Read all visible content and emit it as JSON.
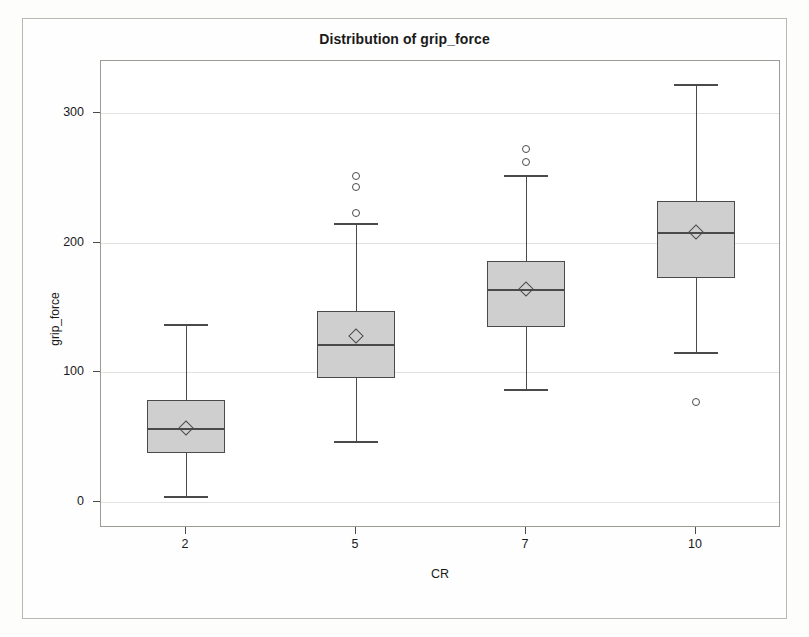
{
  "chart_data": {
    "type": "box",
    "title": "Distribution of grip_force",
    "xlabel": "CR",
    "ylabel": "grip_force",
    "categories": [
      "2",
      "5",
      "7",
      "10"
    ],
    "ylim": [
      -20,
      340
    ],
    "yticks": [
      0,
      100,
      200,
      300
    ],
    "ytick_labels": [
      "0",
      "100",
      "200",
      "300"
    ],
    "grid": true,
    "legend": "none",
    "boxes": [
      {
        "category": "2",
        "whisker_low": 5,
        "q1": 38,
        "median": 57,
        "mean": 57,
        "q3": 79,
        "whisker_high": 137,
        "outliers": []
      },
      {
        "category": "5",
        "whisker_low": 47,
        "q1": 96,
        "median": 122,
        "mean": 128,
        "q3": 147,
        "whisker_high": 215,
        "outliers": [
          223,
          243,
          251
        ]
      },
      {
        "category": "7",
        "whisker_low": 87,
        "q1": 135,
        "median": 164,
        "mean": 164,
        "q3": 186,
        "whisker_high": 252,
        "outliers": [
          262,
          272
        ]
      },
      {
        "category": "10",
        "whisker_low": 116,
        "q1": 173,
        "median": 208,
        "mean": 208,
        "q3": 232,
        "whisker_high": 322,
        "outliers": [
          77
        ]
      }
    ]
  },
  "colors": {
    "box_fill": "#cfcfcf",
    "line": "#4a4a4a",
    "grid": "#e2e2de",
    "text": "#1a1a1a",
    "frame": "#9b9b96",
    "background": "#ffffff"
  }
}
